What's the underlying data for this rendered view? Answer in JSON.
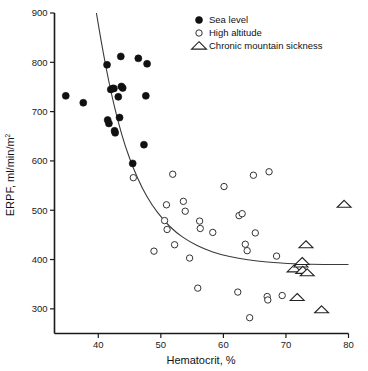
{
  "chart_data": {
    "type": "scatter",
    "title": "",
    "xlabel": "Hematocrit, %",
    "ylabel": "ERPF, ml/min/m",
    "ylabel_superscript": "2",
    "xlim": [
      33,
      80
    ],
    "ylim": [
      250,
      900
    ],
    "xticks": [
      40,
      50,
      60,
      70,
      80
    ],
    "yticks": [
      300,
      400,
      500,
      600,
      700,
      800,
      900
    ],
    "xticklabels": [
      "40",
      "50",
      "60",
      "70",
      "80"
    ],
    "yticklabels": [
      "300",
      "400",
      "500",
      "600",
      "700",
      "800",
      "900"
    ],
    "grid": false,
    "legend_position": "top-right",
    "series": [
      {
        "name": "Sea level",
        "marker": "filled-circle",
        "color": "#111111",
        "points": [
          [
            34.8,
            732
          ],
          [
            37.6,
            718
          ],
          [
            41.4,
            795
          ],
          [
            41.5,
            683
          ],
          [
            41.7,
            676
          ],
          [
            42.0,
            745
          ],
          [
            42.3,
            747
          ],
          [
            42.5,
            747
          ],
          [
            42.6,
            661
          ],
          [
            42.7,
            657
          ],
          [
            43.2,
            730
          ],
          [
            43.4,
            688
          ],
          [
            43.6,
            812
          ],
          [
            43.7,
            751
          ],
          [
            43.9,
            748
          ],
          [
            45.5,
            595
          ],
          [
            46.4,
            808
          ],
          [
            47.3,
            633
          ],
          [
            47.6,
            732
          ],
          [
            47.8,
            797
          ]
        ]
      },
      {
        "name": "High altitude",
        "marker": "open-circle",
        "color": "#333333",
        "points": [
          [
            45.6,
            566
          ],
          [
            48.9,
            417
          ],
          [
            50.6,
            479
          ],
          [
            50.9,
            511
          ],
          [
            51.0,
            461
          ],
          [
            51.9,
            573
          ],
          [
            52.2,
            430
          ],
          [
            53.6,
            518
          ],
          [
            53.9,
            498
          ],
          [
            54.6,
            403
          ],
          [
            55.9,
            342
          ],
          [
            56.2,
            478
          ],
          [
            56.3,
            463
          ],
          [
            58.3,
            455
          ],
          [
            60.1,
            548
          ],
          [
            62.3,
            334
          ],
          [
            62.5,
            489
          ],
          [
            63.0,
            493
          ],
          [
            63.5,
            431
          ],
          [
            63.8,
            418
          ],
          [
            64.2,
            282
          ],
          [
            64.8,
            571
          ],
          [
            65.1,
            454
          ],
          [
            67.0,
            325
          ],
          [
            67.1,
            318
          ],
          [
            67.3,
            578
          ],
          [
            68.5,
            407
          ],
          [
            69.4,
            327
          ]
        ]
      },
      {
        "name": "Chronic mountain sickness",
        "marker": "open-triangle",
        "color": "#222222",
        "points": [
          [
            71.3,
            381
          ],
          [
            71.8,
            323
          ],
          [
            72.4,
            391
          ],
          [
            72.6,
            396
          ],
          [
            72.7,
            378
          ],
          [
            73.2,
            430
          ],
          [
            73.4,
            373
          ],
          [
            75.7,
            298
          ],
          [
            79.3,
            512
          ]
        ]
      }
    ],
    "fit_curve": {
      "description": "decaying exponential regression line through all points",
      "points": [
        [
          39.7,
          900
        ],
        [
          40.5,
          840
        ],
        [
          41.3,
          785
        ],
        [
          42.2,
          730
        ],
        [
          43.2,
          678
        ],
        [
          44.3,
          630
        ],
        [
          45.6,
          585
        ],
        [
          47.0,
          545
        ],
        [
          48.6,
          510
        ],
        [
          50.4,
          480
        ],
        [
          52.4,
          455
        ],
        [
          54.6,
          436
        ],
        [
          57.0,
          421
        ],
        [
          59.6,
          410
        ],
        [
          62.4,
          402
        ],
        [
          65.4,
          397
        ],
        [
          68.6,
          393
        ],
        [
          72.0,
          391
        ],
        [
          76.0,
          390
        ],
        [
          80.0,
          390
        ]
      ]
    }
  },
  "legend": {
    "items": [
      {
        "label": "Sea level",
        "marker": "filled-circle"
      },
      {
        "label": "High altitude",
        "marker": "open-circle"
      },
      {
        "label": "Chronic mountain sickness",
        "marker": "open-triangle"
      }
    ]
  }
}
